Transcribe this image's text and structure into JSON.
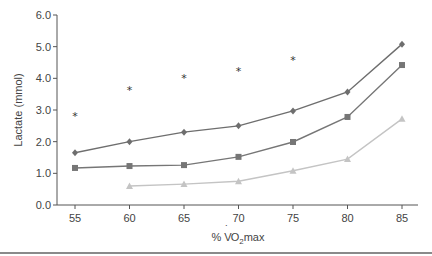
{
  "chart_data": {
    "type": "line",
    "title": "",
    "xlabel": "% V̇O₂max",
    "ylabel": "Lactate (mmol)",
    "x": [
      55,
      60,
      65,
      70,
      75,
      80,
      85
    ],
    "ylim": [
      0,
      6
    ],
    "yticks": [
      "0.0",
      "1.0",
      "2.0",
      "3.0",
      "4.0",
      "5.0",
      "6.0"
    ],
    "xticks": [
      "55",
      "60",
      "65",
      "70",
      "75",
      "80",
      "85"
    ],
    "grid": false,
    "legend": null,
    "series": [
      {
        "name": "diamond-series",
        "marker": "diamond",
        "color": "#6e6e6e",
        "values": [
          1.65,
          2.0,
          2.3,
          2.5,
          2.97,
          3.57,
          5.08
        ]
      },
      {
        "name": "square-series",
        "marker": "square",
        "color": "#767676",
        "values": [
          1.17,
          1.23,
          1.26,
          1.52,
          1.99,
          2.78,
          4.42
        ]
      },
      {
        "name": "triangle-series",
        "marker": "triangle",
        "color": "#c4c4c4",
        "values": [
          null,
          0.6,
          0.66,
          0.75,
          1.08,
          1.45,
          2.72
        ]
      }
    ],
    "annotations": [
      {
        "label": "*",
        "x": 55,
        "y": 2.84
      },
      {
        "label": "*",
        "x": 60,
        "y": 3.66
      },
      {
        "label": "*",
        "x": 65,
        "y": 4.04
      },
      {
        "label": "*",
        "x": 70,
        "y": 4.26
      },
      {
        "label": "*",
        "x": 75,
        "y": 4.61
      }
    ]
  },
  "axes": {
    "x_title_prefix": "% V",
    "x_title_sub": "2",
    "x_title_o": "O",
    "x_title_suffix": "max",
    "y_title": "Lactate (mmol)"
  }
}
